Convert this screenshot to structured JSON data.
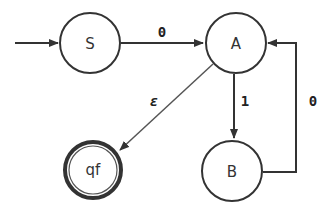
{
  "diagram": {
    "type": "finite-automaton",
    "states": [
      {
        "id": "S",
        "label": "S",
        "start": true,
        "accepting": false
      },
      {
        "id": "A",
        "label": "A",
        "start": false,
        "accepting": false
      },
      {
        "id": "B",
        "label": "B",
        "start": false,
        "accepting": false
      },
      {
        "id": "qf",
        "label": "qf",
        "start": false,
        "accepting": true
      }
    ],
    "transitions": [
      {
        "from": "S",
        "to": "A",
        "label": "0"
      },
      {
        "from": "A",
        "to": "B",
        "label": "1"
      },
      {
        "from": "B",
        "to": "A",
        "label": "0"
      },
      {
        "from": "A",
        "to": "qf",
        "label": "ε"
      }
    ],
    "colors": {
      "stroke": "#333333",
      "background": "#ffffff"
    }
  }
}
